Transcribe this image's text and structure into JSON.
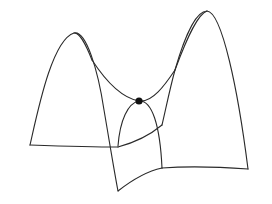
{
  "figure": {
    "colors": {
      "background": "#ffffff",
      "stroke": "#2a2a2a",
      "point": "#111111"
    },
    "critical_point": {
      "x": 139,
      "y": 101,
      "r": 3.6
    }
  }
}
